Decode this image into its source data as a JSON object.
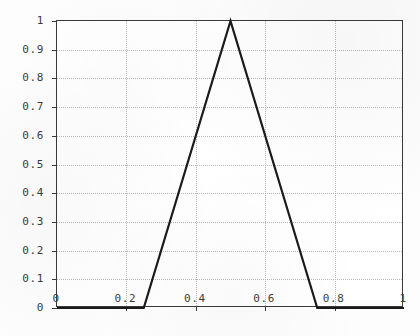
{
  "chart_data": {
    "type": "line",
    "title": "",
    "subtitle": "",
    "xlabel": "",
    "ylabel": "",
    "xlim": [
      0,
      1
    ],
    "ylim": [
      0,
      1
    ],
    "grid": true,
    "legend": null,
    "x_ticks": [
      0,
      0.2,
      0.4,
      0.6,
      0.8,
      1
    ],
    "x_tick_labels": [
      "0",
      "0.2",
      "0.4",
      "0.6",
      "0.8",
      "1"
    ],
    "y_ticks": [
      0,
      0.1,
      0.2,
      0.3,
      0.4,
      0.5,
      0.6,
      0.7,
      0.8,
      0.9,
      1
    ],
    "y_tick_labels": [
      "0",
      "0.1",
      "0.2",
      "0.3",
      "0.4",
      "0.5",
      "0.6",
      "0.7",
      "0.8",
      "0.9",
      "1"
    ],
    "series": [
      {
        "name": "triangular membership",
        "color": "#1a1a1a",
        "line_width": 2.2,
        "x": [
          0,
          0.25,
          0.5,
          0.75,
          1
        ],
        "values": [
          0,
          0,
          1,
          0,
          0
        ],
        "points": [
          {
            "x": 0,
            "y": 0
          },
          {
            "x": 0.25,
            "y": 0
          },
          {
            "x": 0.5,
            "y": 1
          },
          {
            "x": 0.75,
            "y": 0
          },
          {
            "x": 1,
            "y": 0
          }
        ]
      }
    ],
    "annotations": []
  },
  "style": {
    "axis_color": "#3a3a3a",
    "grid_color": "#b9b9b9",
    "background": "#ffffff",
    "tick_label_color": "#3c3c3c"
  }
}
